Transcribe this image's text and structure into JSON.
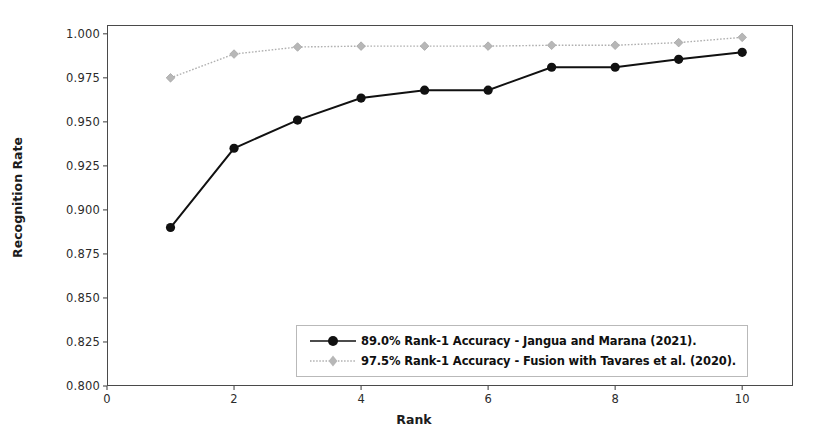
{
  "chart_data": {
    "type": "line",
    "title": "",
    "xlabel": "Rank",
    "ylabel": "Recognition Rate",
    "x": [
      1,
      2,
      3,
      4,
      5,
      6,
      7,
      8,
      9,
      10
    ],
    "xlim": [
      0,
      10.8
    ],
    "ylim": [
      0.8,
      1.005
    ],
    "xticks": [
      0,
      2,
      4,
      6,
      8,
      10
    ],
    "xticklabels": [
      "0",
      "2",
      "4",
      "6",
      "8",
      "10"
    ],
    "yticks": [
      0.8,
      0.825,
      0.85,
      0.875,
      0.9,
      0.925,
      0.95,
      0.975,
      1.0
    ],
    "yticklabels": [
      "0.800",
      "0.825",
      "0.850",
      "0.875",
      "0.900",
      "0.925",
      "0.950",
      "0.975",
      "1.000"
    ],
    "grid": false,
    "legend_position": "lower center",
    "series": [
      {
        "name": "89.0% Rank-1 Accuracy - Jangua and Marana (2021).",
        "color": "#111111",
        "marker": "circle",
        "linestyle": "solid",
        "values": [
          0.89,
          0.935,
          0.951,
          0.9635,
          0.968,
          0.968,
          0.981,
          0.981,
          0.9855,
          0.9895
        ]
      },
      {
        "name": "97.5% Rank-1 Accuracy - Fusion with Tavares et al. (2020).",
        "color": "#b0b0b0",
        "marker": "diamond",
        "linestyle": "dotted",
        "values": [
          0.975,
          0.9885,
          0.9925,
          0.993,
          0.993,
          0.993,
          0.9935,
          0.9935,
          0.995,
          0.998
        ]
      }
    ]
  },
  "legend": {
    "entries": [
      "89.0% Rank-1 Accuracy - Jangua and Marana (2021).",
      "97.5% Rank-1 Accuracy - Fusion with Tavares et al. (2020)."
    ]
  },
  "axes": {
    "xlabel": "Rank",
    "ylabel": "Recognition Rate"
  }
}
